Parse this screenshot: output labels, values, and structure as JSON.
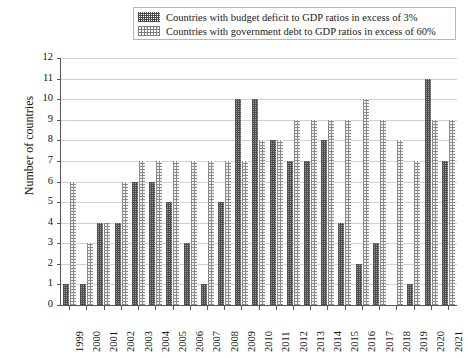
{
  "legend": {
    "position": "top-center",
    "items": [
      {
        "swatch": "dark-crosshatch-swatch",
        "label": "Countries with budget deficit to GDP ratios in excess of 3%",
        "color": "#4f4f4f"
      },
      {
        "swatch": "light-dotted-swatch",
        "label": "Countries with government debt to GDP ratios in excess of 60%",
        "color": "#8a8a8a"
      }
    ]
  },
  "axes": {
    "ylabel": "Number of countries",
    "xlabel": "",
    "yticks": [
      "0",
      "1",
      "2",
      "3",
      "4",
      "5",
      "6",
      "7",
      "8",
      "9",
      "10",
      "11",
      "12"
    ]
  },
  "chart_data": {
    "type": "bar",
    "title": "",
    "subtitle": "",
    "xlabel": "",
    "ylabel": "Number of countries",
    "ylim": [
      0,
      12
    ],
    "ytick_step": 1,
    "grid": true,
    "legend_position": "top-center",
    "categories": [
      "1999",
      "2000",
      "2001",
      "2002",
      "2003",
      "2004",
      "2005",
      "2006",
      "2007",
      "2008",
      "2009",
      "2010",
      "2011",
      "2012",
      "2013",
      "2014",
      "2015",
      "2016",
      "2017",
      "2018",
      "2019",
      "2020",
      "2021"
    ],
    "series": [
      {
        "name": "Countries with budget deficit to GDP ratios in excess of 3%",
        "color": "#4f4f4f",
        "pattern": "dense-crosshatch",
        "values": [
          1,
          1,
          4,
          4,
          6,
          6,
          5,
          3,
          1,
          5,
          10,
          10,
          8,
          7,
          7,
          8,
          4,
          2,
          3,
          0,
          1,
          11,
          7
        ]
      },
      {
        "name": "Countries with government debt to GDP ratios in excess of 60%",
        "color": "#8a8a8a",
        "pattern": "sparse-dotted",
        "values": [
          6,
          3,
          4,
          6,
          7,
          7,
          7,
          7,
          7,
          7,
          7,
          8,
          8,
          9,
          9,
          9,
          9,
          10,
          9,
          8,
          7,
          9,
          9
        ]
      }
    ]
  }
}
